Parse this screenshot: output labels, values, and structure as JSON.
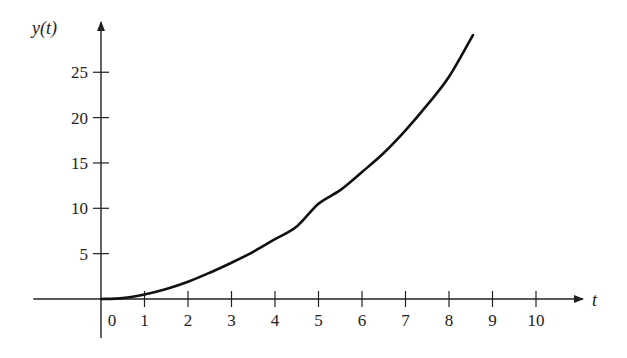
{
  "chart_data": {
    "type": "line",
    "title": "",
    "xlabel": "t",
    "ylabel": "y(t)",
    "x_ticks": [
      0,
      1,
      2,
      3,
      4,
      5,
      6,
      7,
      8,
      9,
      10
    ],
    "x_tick_labels": [
      "0",
      "1",
      "2",
      "3",
      "4",
      "5",
      "6",
      "7",
      "8",
      "9",
      "10"
    ],
    "y_ticks": [
      5,
      10,
      15,
      20,
      25
    ],
    "y_tick_labels": [
      "5",
      "10",
      "15",
      "20",
      "25"
    ],
    "xlim": [
      -2.2,
      11.2
    ],
    "ylim": [
      -2.5,
      29.5
    ],
    "grid": false,
    "legend": null,
    "series": [
      {
        "name": "y(t)",
        "color": "#111111",
        "note": "Values are approximate readings of the plotted curve; the underlying function is not identified.",
        "points": [
          [
            0,
            0
          ],
          [
            0.5,
            0.1
          ],
          [
            1,
            0.5
          ],
          [
            1.5,
            1.1
          ],
          [
            2,
            1.9
          ],
          [
            2.5,
            2.9
          ],
          [
            3,
            4.0
          ],
          [
            3.5,
            5.2
          ],
          [
            4,
            6.6
          ],
          [
            4.5,
            8.0
          ],
          [
            5,
            10.5
          ],
          [
            5.5,
            12.0
          ],
          [
            6,
            14.0
          ],
          [
            6.5,
            16.1
          ],
          [
            7,
            18.6
          ],
          [
            7.5,
            21.4
          ],
          [
            8,
            24.5
          ],
          [
            8.55,
            29.1
          ]
        ]
      }
    ]
  },
  "axes": {
    "x_label": "t",
    "y_label": "y(t)"
  },
  "colors": {
    "axis": "#222222",
    "curve": "#111111",
    "background": "#ffffff"
  }
}
